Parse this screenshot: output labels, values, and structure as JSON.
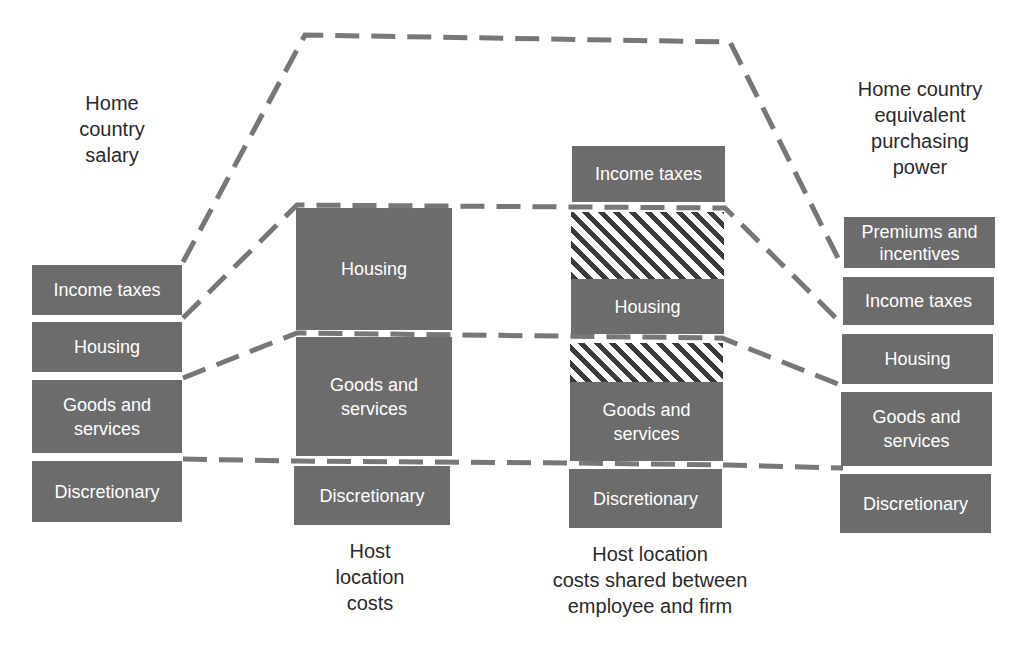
{
  "diagram": {
    "title_fragment": "",
    "colors": {
      "box_fill": "#6c6c6c",
      "box_text": "#ffffff",
      "hatch_dark": "#3b3b3b",
      "dash_line": "#777777",
      "label_text": "#2a2a2a"
    },
    "columns": [
      {
        "id": "home-country-salary",
        "label": "Home country salary",
        "label_lines": [
          "Home",
          "country",
          "salary"
        ],
        "blocks": [
          {
            "name": "income-taxes",
            "text": "Income taxes"
          },
          {
            "name": "housing",
            "text": "Housing"
          },
          {
            "name": "goods-and-services",
            "text": "Goods and services",
            "lines": [
              "Goods and",
              "services"
            ]
          },
          {
            "name": "discretionary",
            "text": "Discretionary"
          }
        ]
      },
      {
        "id": "host-location-costs",
        "label": "Host location costs",
        "label_lines": [
          "Host",
          "location",
          "costs"
        ],
        "blocks": [
          {
            "name": "housing",
            "text": "Housing"
          },
          {
            "name": "goods-and-services",
            "text": "Goods and services",
            "lines": [
              "Goods and",
              "services"
            ]
          },
          {
            "name": "discretionary",
            "text": "Discretionary"
          }
        ]
      },
      {
        "id": "host-location-costs-shared",
        "label": "Host location costs shared between employee and firm",
        "label_lines": [
          "Host location",
          "costs shared between",
          "employee and firm"
        ],
        "blocks": [
          {
            "name": "income-taxes",
            "text": "Income taxes"
          },
          {
            "name": "housing-shared-hatched",
            "text": "",
            "pattern": "hatched"
          },
          {
            "name": "housing",
            "text": "Housing"
          },
          {
            "name": "goods-shared-hatched",
            "text": "",
            "pattern": "hatched"
          },
          {
            "name": "goods-and-services",
            "text": "Goods and services",
            "lines": [
              "Goods and",
              "services"
            ]
          },
          {
            "name": "discretionary",
            "text": "Discretionary"
          }
        ]
      },
      {
        "id": "home-country-equivalent-purchasing-power",
        "label": "Home country equivalent purchasing power",
        "label_lines": [
          "Home country",
          "equivalent",
          "purchasing",
          "power"
        ],
        "blocks": [
          {
            "name": "premiums-and-incentives",
            "text": "Premiums and incentives",
            "lines": [
              "Premiums and",
              "incentives"
            ]
          },
          {
            "name": "income-taxes",
            "text": "Income taxes"
          },
          {
            "name": "housing",
            "text": "Housing"
          },
          {
            "name": "goods-and-services",
            "text": "Goods and services",
            "lines": [
              "Goods and",
              "services"
            ]
          },
          {
            "name": "discretionary",
            "text": "Discretionary"
          }
        ]
      }
    ],
    "connectors": [
      {
        "name": "total-envelope-line",
        "points": [
          [
            183,
            262
          ],
          [
            305,
            35
          ],
          [
            730,
            42
          ],
          [
            843,
            268
          ]
        ]
      },
      {
        "name": "housing-top-line",
        "points": [
          [
            183,
            318
          ],
          [
            297,
            205
          ],
          [
            725,
            208
          ],
          [
            843,
            325
          ]
        ]
      },
      {
        "name": "goods-top-line",
        "points": [
          [
            183,
            378
          ],
          [
            297,
            333
          ],
          [
            722,
            338
          ],
          [
            843,
            386
          ]
        ]
      },
      {
        "name": "discretionary-top-line",
        "points": [
          [
            183,
            459
          ],
          [
            297,
            461
          ],
          [
            570,
            463
          ],
          [
            727,
            465
          ],
          [
            843,
            468
          ]
        ]
      }
    ]
  }
}
